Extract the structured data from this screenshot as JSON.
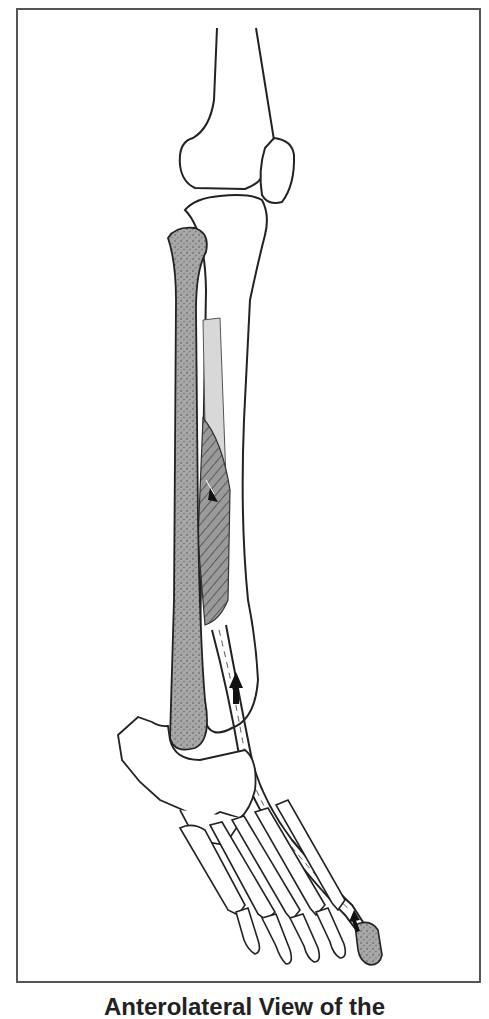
{
  "figure": {
    "caption": "Anterolateral View of the",
    "labels_visible": []
  },
  "colors": {
    "outline": "#222222",
    "frame": "#555555",
    "stippled_bone": "#9a9a9a",
    "light_shade": "#d4d4d4",
    "muscle_hatch": "#8a8a8a",
    "arrow": "#111111"
  },
  "elements": {
    "femur": "femur-bone",
    "patella": "patella-bone",
    "tibia": "tibia-bone",
    "fibula": "fibula-bone-shaded",
    "interosseous_membrane": "membrane-shaded",
    "muscle": "muscle-belly-hatched",
    "tendon": "tendon-dashed",
    "foot": "foot-bones",
    "great_toe_distal_phalanx": "toe-phalanx-shaded",
    "arrows": [
      "arrow-muscle",
      "arrow-ankle",
      "arrow-toe"
    ]
  }
}
